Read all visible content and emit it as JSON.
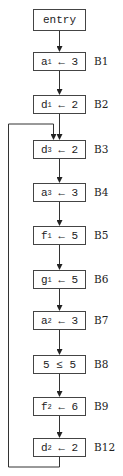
{
  "diagram": {
    "type": "control-flow-graph",
    "entry": {
      "label": "entry"
    },
    "blocks": [
      {
        "id": "B1",
        "var": "a",
        "sub": "1",
        "op": "←",
        "val": "3"
      },
      {
        "id": "B2",
        "var": "d",
        "sub": "1",
        "op": "←",
        "val": "2"
      },
      {
        "id": "B3",
        "var": "d",
        "sub": "3",
        "op": "←",
        "val": "2"
      },
      {
        "id": "B4",
        "var": "a",
        "sub": "3",
        "op": "←",
        "val": "3"
      },
      {
        "id": "B5",
        "var": "f",
        "sub": "1",
        "op": "←",
        "val": "5"
      },
      {
        "id": "B6",
        "var": "g",
        "sub": "1",
        "op": "←",
        "val": "5"
      },
      {
        "id": "B7",
        "var": "a",
        "sub": "2",
        "op": "←",
        "val": "3"
      },
      {
        "id": "B8",
        "var": "5",
        "sub": "",
        "op": "≤",
        "val": "5"
      },
      {
        "id": "B9",
        "var": "f",
        "sub": "2",
        "op": "←",
        "val": "6"
      },
      {
        "id": "B12",
        "var": "d",
        "sub": "2",
        "op": "←",
        "val": "2"
      }
    ],
    "edges": [
      [
        "entry",
        "B1"
      ],
      [
        "B1",
        "B2"
      ],
      [
        "B2",
        "B3"
      ],
      [
        "B3",
        "B4"
      ],
      [
        "B4",
        "B5"
      ],
      [
        "B5",
        "B6"
      ],
      [
        "B6",
        "B7"
      ],
      [
        "B7",
        "B8"
      ],
      [
        "B8",
        "B9"
      ],
      [
        "B9",
        "B12"
      ],
      [
        "B12",
        "B3"
      ]
    ]
  }
}
